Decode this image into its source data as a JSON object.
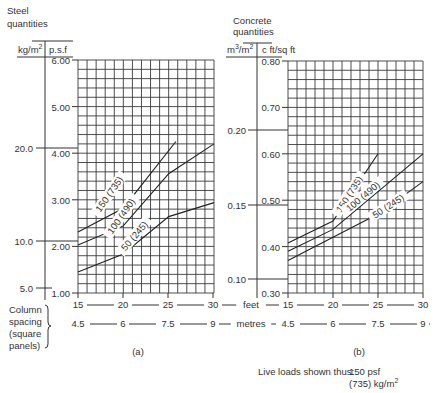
{
  "chart_data": [
    {
      "type": "line",
      "panel": "(a)",
      "title": "Steel quantities",
      "ylabel_left": "kg/m2",
      "ylabel_right": "p.s.f",
      "xlabel": "Column spacing (square panels)",
      "x_feet": [
        15,
        20,
        25,
        30
      ],
      "x_metres": [
        4.5,
        6,
        7.5,
        9
      ],
      "y_psf_ticks": [
        "6.00",
        "5.00",
        "4.00",
        "3.00",
        "2.00",
        "1.00"
      ],
      "y_kg_ticks": [
        "20.0",
        "10.0",
        "5.0"
      ],
      "ylim": [
        1.0,
        6.0
      ],
      "xlim": [
        15,
        30
      ],
      "grid": true,
      "series": [
        {
          "name": "150 (735)",
          "x": [
            15,
            20,
            25.8
          ],
          "values": [
            2.31,
            2.82,
            4.25
          ]
        },
        {
          "name": "100 (490)",
          "x": [
            15,
            20,
            25,
            30
          ],
          "values": [
            2.03,
            2.44,
            3.56,
            4.2
          ]
        },
        {
          "name": "50 (245)",
          "x": [
            15,
            20,
            25,
            30
          ],
          "values": [
            1.45,
            1.84,
            2.64,
            2.94
          ]
        }
      ]
    },
    {
      "type": "line",
      "panel": "(b)",
      "title": "Concrete quantities",
      "ylabel_left": "m3/m2",
      "ylabel_right": "c ft/sq ft",
      "xlabel": "Column spacing (square panels)",
      "x_feet": [
        15,
        20,
        25,
        30
      ],
      "x_metres": [
        4.5,
        6,
        7.5,
        9
      ],
      "y_cft_ticks": [
        "0.80",
        "0.70",
        "0.60",
        "0.50",
        "0.40",
        "0.30"
      ],
      "y_m3_ticks": [
        "0.20",
        "0.15",
        "0.10"
      ],
      "ylim": [
        0.3,
        0.8
      ],
      "xlim": [
        15,
        30
      ],
      "grid": true,
      "series": [
        {
          "name": "150 (735)",
          "x": [
            15,
            20,
            25
          ],
          "values": [
            0.408,
            0.455,
            0.6
          ]
        },
        {
          "name": "100 (490)",
          "x": [
            15,
            20,
            30
          ],
          "values": [
            0.39,
            0.437,
            0.6
          ]
        },
        {
          "name": "50 (245)",
          "x": [
            15,
            20,
            25,
            30
          ],
          "values": [
            0.37,
            0.42,
            0.47,
            0.54
          ]
        }
      ]
    }
  ],
  "labels": {
    "steel_title_1": "Steel",
    "steel_title_2": "quantities",
    "steel_unit_left": "kg/m",
    "steel_unit_right": "p.s.f",
    "concrete_title_1": "Concrete",
    "concrete_title_2": "quantities",
    "concrete_unit_left": "m",
    "concrete_unit_left_mid": "/m",
    "concrete_unit_right": "c ft/sq ft",
    "sup2": "2",
    "sup3": "3",
    "col_1": "Column",
    "col_2": "spacing",
    "col_3": "(square",
    "col_4": "panels)",
    "feet": "feet",
    "metres": "metres",
    "panel_a": "(a)",
    "panel_b": "(b)",
    "legend_intro": "Live loads shown thus:",
    "legend_val_1": "150 psf",
    "legend_val_2": "(735) kg/m",
    "series_150": "150 (735)",
    "series_100": "100 (490)",
    "series_50": "50 (245)"
  }
}
